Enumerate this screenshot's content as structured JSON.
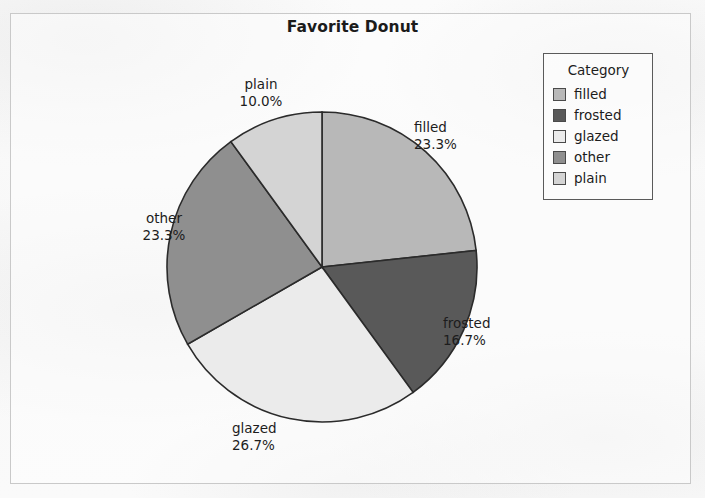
{
  "chart_data": {
    "type": "pie",
    "title": "Favorite Donut",
    "categories": [
      "filled",
      "frosted",
      "glazed",
      "other",
      "plain"
    ],
    "values": [
      23.3,
      16.7,
      26.7,
      23.3,
      10.0
    ],
    "value_labels": [
      "23.3%",
      "16.7%",
      "26.7%",
      "23.3%",
      "10.0%"
    ],
    "colors": [
      "#b8b8b8",
      "#595959",
      "#ebebeb",
      "#8f8f8f",
      "#d4d4d4"
    ],
    "start_angle_deg": 0,
    "direction": "clockwise",
    "xlabel": "",
    "ylabel": "",
    "grid": false,
    "legend_position": "top-right",
    "slice_outline_color": "#2b2b2b"
  },
  "title": "Favorite Donut",
  "legend": {
    "title": "Category",
    "items": [
      {
        "label": "filled",
        "color": "#b8b8b8"
      },
      {
        "label": "frosted",
        "color": "#595959"
      },
      {
        "label": "glazed",
        "color": "#ebebeb"
      },
      {
        "label": "other",
        "color": "#8f8f8f"
      },
      {
        "label": "plain",
        "color": "#d4d4d4"
      }
    ]
  },
  "slice_labels": {
    "filled": {
      "name": "filled",
      "pct": "23.3%"
    },
    "frosted": {
      "name": "frosted",
      "pct": "16.7%"
    },
    "glazed": {
      "name": "glazed",
      "pct": "26.7%"
    },
    "other": {
      "name": "other",
      "pct": "23.3%"
    },
    "plain": {
      "name": "plain",
      "pct": "10.0%"
    }
  }
}
